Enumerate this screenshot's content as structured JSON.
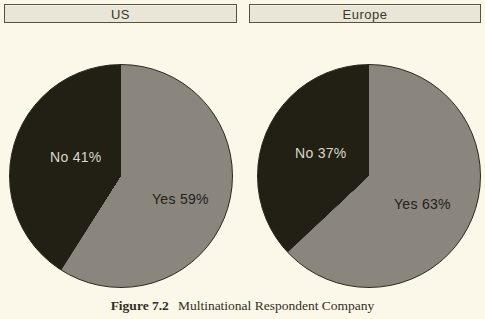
{
  "figure": {
    "caption_label": "Figure 7.2",
    "caption_text": "Multinational Respondent Company"
  },
  "panels": [
    {
      "header": "US",
      "no_label": "No 41%",
      "yes_label": "Yes 59%"
    },
    {
      "header": "Europe",
      "no_label": "No 37%",
      "yes_label": "Yes 63%"
    }
  ],
  "colors": {
    "page_background": "#fbf8ea",
    "header_fill": "#e9e6d7",
    "header_border": "#57523f",
    "slice_yes": "#8a867e",
    "slice_no": "#221f14",
    "no_label_text": "#dbd8ca",
    "yes_label_text": "#23211a",
    "caption_text": "#332e22"
  },
  "chart_data": [
    {
      "type": "pie",
      "title": "US",
      "labels": [
        "Yes",
        "No"
      ],
      "values": [
        59,
        41
      ],
      "unit": "%",
      "colors": {
        "Yes": "#8a867e",
        "No": "#221f14"
      },
      "start_angle_deg": 0,
      "direction": "clockwise",
      "legend_position": "none",
      "data_labels": [
        "Yes 59%",
        "No 41%"
      ]
    },
    {
      "type": "pie",
      "title": "Europe",
      "labels": [
        "Yes",
        "No"
      ],
      "values": [
        63,
        37
      ],
      "unit": "%",
      "colors": {
        "Yes": "#8a867e",
        "No": "#221f14"
      },
      "start_angle_deg": 0,
      "direction": "clockwise",
      "legend_position": "none",
      "data_labels": [
        "Yes 63%",
        "No 37%"
      ]
    }
  ]
}
